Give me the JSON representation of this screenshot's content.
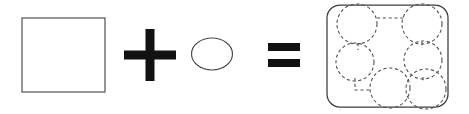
{
  "figure": {
    "type": "shape-equation",
    "background_color": "#ffffff",
    "stroke_color": "#4a4a4a",
    "dashed_stroke_color": "#575757",
    "operator_color": "#121212",
    "width": 469,
    "height": 114
  },
  "terms": [
    {
      "id": "square",
      "label": "square",
      "shape": "rectangle",
      "x": 22,
      "y": 18,
      "width": 83,
      "height": 74,
      "fill": "none",
      "stroke": "#4a4a4a"
    },
    {
      "id": "ellipse",
      "label": "ellipse",
      "shape": "ellipse",
      "cx": 212,
      "cy": 54,
      "rx": 20.5,
      "ry": 16,
      "fill": "none",
      "stroke": "#4a4a4a"
    },
    {
      "id": "result",
      "label": "rounded square with circles",
      "shape": "rounded-rectangle",
      "x": 327,
      "y": 5,
      "width": 121,
      "height": 102,
      "corner_radius": 13,
      "fill": "none",
      "stroke": "#3c3c3c"
    }
  ],
  "operators": [
    {
      "id": "plus",
      "symbol": "+",
      "name": "plus-sign",
      "cx": 150,
      "cy": 55,
      "arm_length": 26,
      "arm_thickness": 9
    },
    {
      "id": "equals",
      "symbol": "=",
      "name": "equals-sign",
      "cx": 284,
      "cy": 55,
      "bar_width": 32,
      "bar_thickness": 8,
      "bar_gap": 8
    }
  ],
  "result_circles": [
    {
      "id": "circle-top-left",
      "label": "top-left circle",
      "cx": 357,
      "cy": 24,
      "r": 20
    },
    {
      "id": "circle-top-right",
      "label": "top-right circle",
      "cx": 422,
      "cy": 24,
      "r": 20
    },
    {
      "id": "circle-middle-left",
      "label": "middle-left circle",
      "cx": 355,
      "cy": 62,
      "r": 19
    },
    {
      "id": "circle-middle-right",
      "label": "middle-right circle",
      "cx": 423,
      "cy": 60,
      "r": 19
    },
    {
      "id": "circle-bottom-center",
      "label": "bottom-center circle",
      "cx": 390,
      "cy": 88,
      "r": 20
    },
    {
      "id": "circle-bottom-right",
      "label": "bottom-right circle",
      "cx": 426,
      "cy": 89,
      "r": 20
    }
  ],
  "result_connectors": [
    {
      "id": "connector-top-horizontal",
      "label": "top horizontal connector",
      "points": "377,18 405,18"
    },
    {
      "id": "connector-top-left-vertical",
      "label": "top-left vertical connector",
      "points": "358,43 358,50"
    },
    {
      "id": "connector-top-right-vertical",
      "label": "top-right vertical connector",
      "points": "422,42 422,48"
    },
    {
      "id": "connector-bottom-left-elbow",
      "label": "bottom-left elbow connector",
      "points": "355,78 355,90 372,90"
    },
    {
      "id": "connector-middle-right-short",
      "label": "middle-right short connector",
      "points": "423,77 423,82"
    }
  ],
  "accessibility": {
    "description": "Diagram showing a plain square plus an ellipse equals a rounded square filled with six dashed circles connected by dashed lines."
  }
}
